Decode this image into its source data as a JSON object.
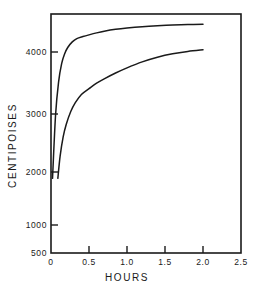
{
  "chart_data": {
    "type": "line",
    "title": "",
    "xlabel": "HOURS",
    "ylabel": "CENTIPOISES",
    "xlim": [
      0,
      2.5
    ],
    "ylim": [
      500,
      4600
    ],
    "yscale": "log",
    "xscale": "linear",
    "grid": false,
    "legend": "none",
    "frame": "box",
    "xticks": [
      "0",
      "0.5",
      "1.0",
      "1.5",
      "2.0",
      "2.5"
    ],
    "xtick_values": [
      0,
      0.5,
      1.0,
      1.5,
      2.0,
      2.5
    ],
    "yticks": [
      "500",
      "1000",
      "2000",
      "3000",
      "4000"
    ],
    "ytick_values": [
      500,
      1000,
      2000,
      3000,
      4000
    ],
    "series": [
      {
        "name": "upper-curve",
        "x": [
          0.02,
          0.06,
          0.1,
          0.14,
          0.18,
          0.22,
          0.28,
          0.34,
          0.42,
          0.5,
          0.6,
          0.7,
          0.85,
          1.0,
          1.2,
          1.4,
          1.6,
          1.8,
          2.0
        ],
        "values": [
          1000,
          1800,
          2450,
          2900,
          3180,
          3370,
          3550,
          3660,
          3730,
          3790,
          3860,
          3920,
          3990,
          4040,
          4090,
          4125,
          4150,
          4168,
          4180
        ]
      },
      {
        "name": "lower-curve",
        "x": [
          0.09,
          0.12,
          0.16,
          0.2,
          0.26,
          0.32,
          0.4,
          0.5,
          0.6,
          0.7,
          0.85,
          1.0,
          1.2,
          1.4,
          1.6,
          1.8,
          2.0
        ],
        "values": [
          1000,
          1230,
          1470,
          1650,
          1860,
          2020,
          2180,
          2300,
          2420,
          2520,
          2660,
          2790,
          2950,
          3080,
          3180,
          3250,
          3300
        ]
      }
    ]
  },
  "axes": {
    "x_title": "HOURS",
    "y_title": "CENTIPOISES"
  }
}
